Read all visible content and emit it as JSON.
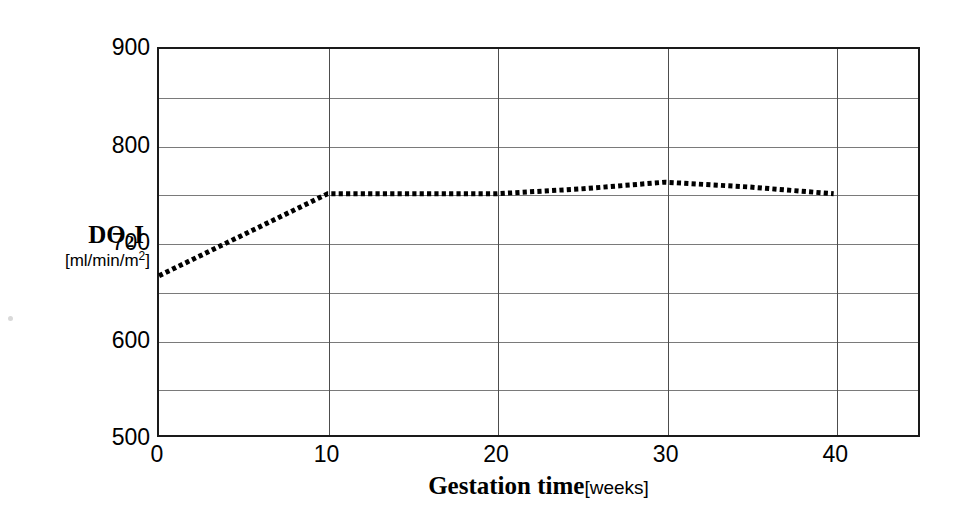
{
  "chart_data": {
    "type": "line",
    "title": "",
    "subtitle": "",
    "xlabel_main": "Gestation time",
    "xlabel_units": "[weeks]",
    "ylabel_main": "DO",
    "ylabel_sub": "2",
    "ylabel_main_tail": "I",
    "ylabel_units_pre": "[ml/min/m",
    "ylabel_units_sup": "2",
    "ylabel_units_post": "]",
    "xlim": [
      0,
      45
    ],
    "ylim": [
      500,
      900
    ],
    "grid": "both",
    "legend": "none",
    "x_major_ticks": [
      0,
      10,
      20,
      30,
      40
    ],
    "x_tick_labels": [
      "0",
      "10",
      "20",
      "30",
      "40"
    ],
    "y_major_ticks": [
      500,
      600,
      700,
      800,
      900
    ],
    "y_tick_labels": [
      "500",
      "600",
      "700",
      "800",
      "900"
    ],
    "y_gridlines": [
      550,
      600,
      650,
      700,
      750,
      800,
      850
    ],
    "x_gridlines": [
      10,
      20,
      30,
      40
    ],
    "line_style": "dotted",
    "line_color": "#000000",
    "line_width": 5,
    "series": [
      {
        "name": "DO2I",
        "x": [
          0,
          10,
          20,
          25,
          30,
          35,
          40
        ],
        "values": [
          665,
          750,
          750,
          755,
          762,
          757,
          750
        ]
      }
    ]
  },
  "figure": {
    "background_color": "#ffffff",
    "frame_color": "#1a1a1a",
    "hgrid_color": "#7a7a7a",
    "vgrid_color": "#4d4d4d"
  }
}
